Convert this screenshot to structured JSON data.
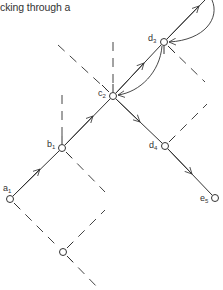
{
  "caption": "cking through a",
  "colors": {
    "stroke": "#333333",
    "dashed": "#444444",
    "background": "#ffffff"
  },
  "nodes": [
    {
      "id": "a1",
      "letter": "a",
      "sub": "1",
      "x": 10,
      "y": 199
    },
    {
      "id": "b1",
      "letter": "b",
      "sub": "1",
      "x": 62,
      "y": 148
    },
    {
      "id": "c2",
      "letter": "c",
      "sub": "2",
      "x": 113,
      "y": 96
    },
    {
      "id": "d3",
      "letter": "d",
      "sub": "3",
      "x": 164,
      "y": 42
    },
    {
      "id": "d4",
      "letter": "d",
      "sub": "4",
      "x": 165,
      "y": 146
    },
    {
      "id": "e5",
      "letter": "e",
      "sub": "5",
      "x": 215,
      "y": 198
    },
    {
      "id": "bottom",
      "letter": "",
      "sub": "",
      "x": 63,
      "y": 252
    }
  ],
  "edges": [
    {
      "from": "a1",
      "to": "b1",
      "style": "solid",
      "arrow": true
    },
    {
      "from": "b1",
      "to": "c2",
      "style": "solid",
      "arrow": true
    },
    {
      "from": "c2",
      "to": "d3",
      "style": "solid",
      "arrow": true
    },
    {
      "from": "d3",
      "to": "top",
      "style": "solid",
      "arrow": true
    },
    {
      "from": "c2",
      "to": "d4",
      "style": "solid",
      "arrow": true
    },
    {
      "from": "d4",
      "to": "e5",
      "style": "solid",
      "arrow": true
    },
    {
      "from": "d3",
      "to": "c2",
      "style": "curved-backtrack",
      "arrow": true
    },
    {
      "from": "top",
      "to": "d3",
      "style": "curved-backtrack",
      "arrow": true
    }
  ]
}
